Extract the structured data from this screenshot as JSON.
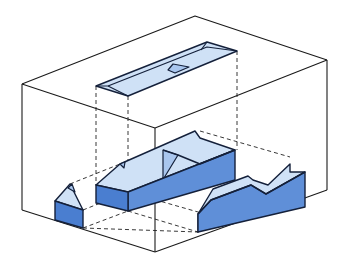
{
  "diagram": {
    "title": "",
    "colors": {
      "background": "#ffffff",
      "box_lines": "#1a1a1a",
      "outline": "#14203a",
      "face_light": "#cfe1f6",
      "face_mid": "#a9c6ee",
      "face_dark": "#5f8fd8",
      "face_darker": "#4a7ed0"
    },
    "views": [
      {
        "name": "top view",
        "plane": "top"
      },
      {
        "name": "front view",
        "plane": "front"
      },
      {
        "name": "side view",
        "plane": "left"
      },
      {
        "name": "isometric object",
        "plane": "center"
      }
    ]
  }
}
